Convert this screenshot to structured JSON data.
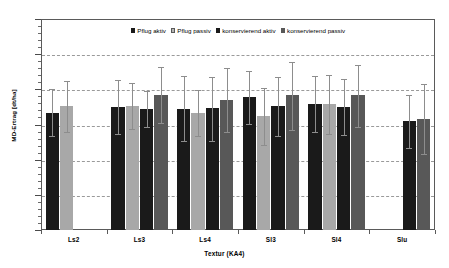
{
  "chart_data": {
    "type": "bar",
    "title": "",
    "xlabel": "Textur (KA4)",
    "ylabel": "MD-Ertrag [dt/ha]",
    "ylim": [
      0,
      60
    ],
    "ytick_values": [
      0,
      10,
      20,
      30,
      40,
      50,
      60
    ],
    "ytick_labels": [
      "0",
      "10",
      "20",
      "30",
      "40",
      "50",
      "60"
    ],
    "grid": true,
    "grid_axis": "y",
    "legend_position": "top-center",
    "error_bars": "standard deviation",
    "categories": [
      "Ls2",
      "Ls3",
      "Ls4",
      "Sl3",
      "Sl4",
      "Slu"
    ],
    "series": [
      {
        "name": "Pflug aktiv",
        "color": "#1a1a1a",
        "values": [
          33.3,
          35.1,
          34.5,
          37.8,
          35.9,
          null
        ],
        "err_low": [
          26.7,
          27.4,
          25.2,
          30.2,
          27.9,
          null
        ],
        "err_high": [
          40.1,
          42.7,
          43.7,
          45.3,
          43.7,
          null
        ]
      },
      {
        "name": "Pflug passiv",
        "color": "#a8a8a8",
        "values": [
          35.3,
          35.3,
          33.4,
          32.3,
          35.7,
          null
        ],
        "err_low": [
          28.0,
          28.7,
          26.8,
          24.1,
          27.2,
          null
        ],
        "err_high": [
          42.5,
          41.9,
          39.8,
          40.3,
          44.2,
          null
        ]
      },
      {
        "name": "konservierend aktiv",
        "color": "#1a1a1a",
        "values": [
          null,
          34.4,
          34.7,
          35.2,
          34.9,
          31.0
        ],
        "err_low": [
          null,
          29.2,
          25.4,
          26.6,
          27.0,
          23.2
        ],
        "err_high": [
          null,
          39.6,
          43.4,
          43.5,
          42.9,
          38.5
        ]
      },
      {
        "name": "konservierend passiv",
        "color": "#585858",
        "values": [
          null,
          38.3,
          37.1,
          38.3,
          38.4,
          31.7
        ],
        "err_low": [
          null,
          30.3,
          28.0,
          28.4,
          29.2,
          21.6
        ],
        "err_high": [
          null,
          46.3,
          46.1,
          47.8,
          46.9,
          41.6
        ]
      }
    ]
  },
  "legend": {
    "entries": [
      {
        "label": "Pflug aktiv"
      },
      {
        "label": "Pflug passiv"
      },
      {
        "label": "konservierend aktiv"
      },
      {
        "label": "konservierend passiv"
      }
    ]
  },
  "axes": {
    "y_title": "MD-Ertrag [dt/ha]",
    "x_title": "Textur (KA4)"
  }
}
